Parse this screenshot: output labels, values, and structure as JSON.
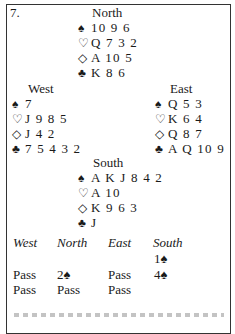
{
  "deal_number": "7.",
  "north": {
    "label": "North",
    "spades": "10 9 6",
    "hearts": "Q 7 3 2",
    "diamonds": "A 10 5",
    "clubs": "K 8 6"
  },
  "west": {
    "label": "West",
    "spades": "7",
    "hearts": "J 9 8 5",
    "diamonds": "J 4 2",
    "clubs": "7 5 4 3 2"
  },
  "east": {
    "label": "East",
    "spades": "Q 5 3",
    "hearts": "K 6 4",
    "diamonds": "Q 8 7",
    "clubs": "A Q 10 9"
  },
  "south": {
    "label": "South",
    "spades": "A K J 8 4 2",
    "hearts": "A 10",
    "diamonds": "K 9 6 3",
    "clubs": "J"
  },
  "suit_symbols": {
    "spades": "♠",
    "hearts": "♡",
    "diamonds": "◇",
    "clubs": "♣"
  },
  "bidding": {
    "headers": [
      "West",
      "North",
      "East",
      "South"
    ],
    "rows": [
      [
        "",
        "",
        "",
        "1♠"
      ],
      [
        "Pass",
        "2♠",
        "Pass",
        "4♠"
      ],
      [
        "Pass",
        "Pass",
        "Pass",
        ""
      ]
    ]
  }
}
